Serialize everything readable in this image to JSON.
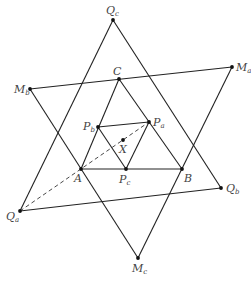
{
  "diagram": {
    "type": "geometry",
    "points": {
      "Qc": {
        "x": 113,
        "y": 20,
        "label": "Q",
        "sub": "c",
        "lx": 106,
        "ly": 14
      },
      "Ma": {
        "x": 232,
        "y": 67,
        "label": "M",
        "sub": "a",
        "lx": 236,
        "ly": 71
      },
      "Mb": {
        "x": 30,
        "y": 89,
        "label": "M",
        "sub": "b",
        "lx": 14,
        "ly": 93
      },
      "C": {
        "x": 119,
        "y": 79,
        "label": "C",
        "sub": "",
        "lx": 113,
        "ly": 75
      },
      "Pb": {
        "x": 98,
        "y": 127,
        "label": "P",
        "sub": "b",
        "lx": 83,
        "ly": 130
      },
      "Pa": {
        "x": 149,
        "y": 122,
        "label": "P",
        "sub": "a",
        "lx": 153,
        "ly": 126
      },
      "X": {
        "x": 123,
        "y": 140,
        "label": "X",
        "sub": "",
        "lx": 119,
        "ly": 153
      },
      "A": {
        "x": 81,
        "y": 169,
        "label": "A",
        "sub": "",
        "lx": 74,
        "ly": 182
      },
      "Pc": {
        "x": 126,
        "y": 169,
        "label": "P",
        "sub": "c",
        "lx": 119,
        "ly": 183
      },
      "B": {
        "x": 182,
        "y": 169,
        "label": "B",
        "sub": "",
        "lx": 184,
        "ly": 182
      },
      "Qa": {
        "x": 20,
        "y": 211,
        "label": "Q",
        "sub": "a",
        "lx": 6,
        "ly": 220
      },
      "Qb": {
        "x": 221,
        "y": 188,
        "label": "Q",
        "sub": "b",
        "lx": 226,
        "ly": 192
      },
      "Mc": {
        "x": 138,
        "y": 258,
        "label": "M",
        "sub": "c",
        "lx": 132,
        "ly": 272
      }
    },
    "segments": [
      {
        "from": "Qc",
        "to": "Qa",
        "style": "solid"
      },
      {
        "from": "Qa",
        "to": "Qb",
        "style": "solid"
      },
      {
        "from": "Qb",
        "to": "Qc",
        "style": "solid"
      },
      {
        "from": "Ma",
        "to": "Mb",
        "style": "solid"
      },
      {
        "from": "Mb",
        "to": "Mc",
        "style": "solid"
      },
      {
        "from": "Mc",
        "to": "Ma",
        "style": "solid"
      },
      {
        "from": "A",
        "to": "B",
        "style": "solid"
      },
      {
        "from": "B",
        "to": "C",
        "style": "solid"
      },
      {
        "from": "C",
        "to": "A",
        "style": "solid"
      },
      {
        "from": "Pa",
        "to": "Pb",
        "style": "solid"
      },
      {
        "from": "Pb",
        "to": "Pc",
        "style": "solid"
      },
      {
        "from": "Pc",
        "to": "Pa",
        "style": "solid"
      },
      {
        "from": "Qa",
        "to": "Pa",
        "style": "dashed"
      }
    ]
  }
}
